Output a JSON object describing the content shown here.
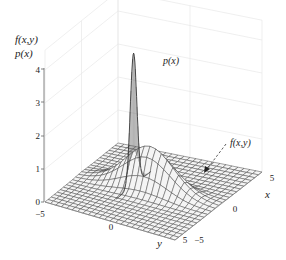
{
  "chart_data": {
    "type": "surface3d",
    "title": "",
    "zlabel_lines": [
      "f(x,y)",
      "p(x)"
    ],
    "xlabel": "x",
    "ylabel": "y",
    "xlim": [
      -5,
      5
    ],
    "ylim": [
      -5,
      5
    ],
    "zlim": [
      0,
      4
    ],
    "z_ticks": [
      "0",
      "1",
      "2",
      "3",
      "4"
    ],
    "x_ticks": [
      "-5",
      "0",
      "5"
    ],
    "y_ticks": [
      "-5",
      "0",
      "5"
    ],
    "x_tick_labels": [
      "−5",
      "0",
      "5"
    ],
    "y_tick_labels": [
      "−5",
      "0",
      "5"
    ],
    "annotations": [
      {
        "text": "p(x)",
        "target": "peak of marginal curve p(x)"
      },
      {
        "text": "f(x,y)",
        "target": "joint density surface",
        "arrow": "dashed"
      }
    ],
    "series": [
      {
        "name": "f(x,y)",
        "kind": "mesh surface",
        "peak": 1.3
      },
      {
        "name": "p(x)",
        "kind": "marginal curve",
        "peak": 4.0
      }
    ],
    "grid": true
  },
  "colors": {
    "mesh_line": "#333333",
    "surface_fill": "#f2f2f2",
    "axis": "#555555",
    "grid": "#e6e6e6",
    "text": "#222222"
  }
}
